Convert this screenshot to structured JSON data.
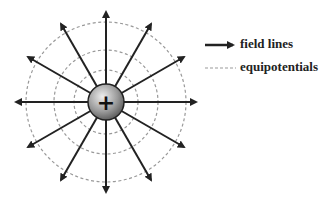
{
  "diagram": {
    "center": [
      106,
      102
    ],
    "charge": {
      "symbol": "+",
      "radius": 18
    },
    "equipotential_radii": [
      32,
      52,
      80
    ],
    "field_line_count": 12,
    "field_line_length": 90,
    "colors": {
      "line": "#222222",
      "equipotential": "#999999"
    }
  },
  "legend": {
    "field_lines": "field lines",
    "equipotentials": "equipotentials"
  }
}
